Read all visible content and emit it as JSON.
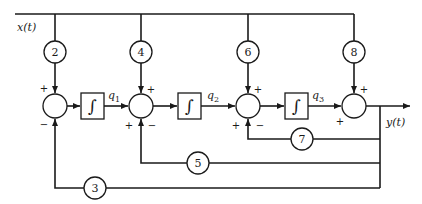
{
  "diagram": {
    "type": "block-diagram",
    "input_label": "x(t)",
    "output_label": "y(t)",
    "feedforward_gains": [
      {
        "id": "g2",
        "value": "2",
        "x": 55
      },
      {
        "id": "g4",
        "value": "4",
        "x": 141
      },
      {
        "id": "g6",
        "value": "6",
        "x": 248
      },
      {
        "id": "g8",
        "value": "8",
        "x": 354
      }
    ],
    "feedback_gains": [
      {
        "id": "g7",
        "value": "7",
        "to_junction": 3
      },
      {
        "id": "g5",
        "value": "5",
        "to_junction": 2
      },
      {
        "id": "g3",
        "value": "3",
        "to_junction": 1
      }
    ],
    "integrators": [
      {
        "symbol": "∫",
        "output_state": "q",
        "output_index": "1"
      },
      {
        "symbol": "∫",
        "output_state": "q",
        "output_index": "2"
      },
      {
        "symbol": "∫",
        "output_state": "q",
        "output_index": "3"
      }
    ],
    "junction_signs": {
      "s1": {
        "top": "+",
        "bottom": "−"
      },
      "s2": {
        "top": "+",
        "left": "+",
        "bottom": "−"
      },
      "s3": {
        "top": "+",
        "left": "+",
        "bottom": "−"
      },
      "s4": {
        "top": "+",
        "left": "+"
      }
    }
  }
}
